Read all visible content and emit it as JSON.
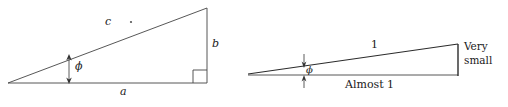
{
  "figure": {
    "background_color": "#ffffff",
    "stroke_color": "#2b2b2b",
    "text_color": "#1a1a1a"
  },
  "left_triangle": {
    "name": "general-right-triangle",
    "hypotenuse_label": "c",
    "vertical_label": "b",
    "base_label": "a",
    "angle_label": "ϕ",
    "right_angle_marker": "right-angle-square",
    "tick_marker": "hypotenuse-dot"
  },
  "right_triangle": {
    "name": "small-angle-triangle",
    "hypotenuse_label": "1",
    "vertical_label_line1": "Very",
    "vertical_label_line2": "small",
    "base_label": "Almost 1",
    "angle_label": "ϕ"
  }
}
